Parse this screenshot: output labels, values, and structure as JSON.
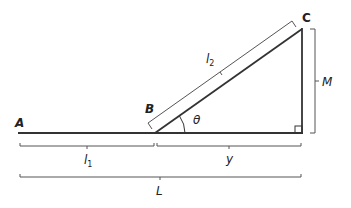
{
  "diagram": {
    "type": "geometry-right-triangle",
    "points": {
      "A": "A",
      "B": "B",
      "C": "C"
    },
    "labels": {
      "l1": "l",
      "l1_sub": "1",
      "l2": "l",
      "l2_sub": "2",
      "y": "y",
      "L": "L",
      "M": "M",
      "theta": "θ"
    },
    "colors": {
      "line": "#333333",
      "bracket": "#555555",
      "text": "#222222"
    }
  }
}
